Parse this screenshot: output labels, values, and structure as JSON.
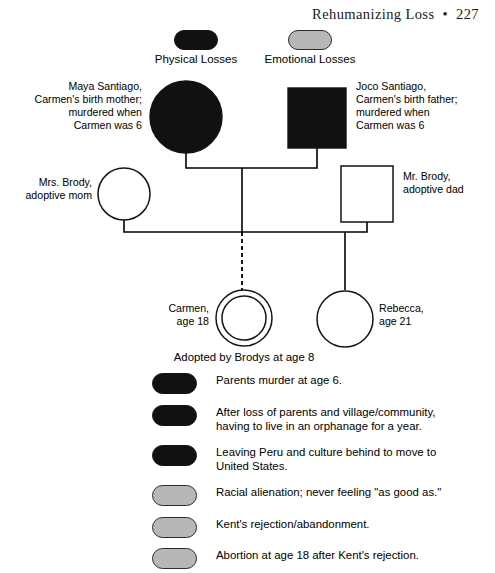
{
  "page": {
    "header": "Rehumanizing Loss  •  227"
  },
  "key": {
    "items": [
      {
        "label": "Physical Losses",
        "color": "#111111",
        "type": "physical"
      },
      {
        "label": "Emotional Losses",
        "color": "#b7b7b7",
        "type": "emotional"
      }
    ]
  },
  "genogram": {
    "people": [
      {
        "id": "maya",
        "label": "Maya Santiago,\nCarmen's birth mother;\nmurdered when\nCarmen was 6",
        "lines": [
          "Maya Santiago,",
          "Carmen's birth mother;",
          "murdered when",
          "Carmen was 6"
        ],
        "shape": "circle",
        "fill": "filled",
        "role": "birth-mother"
      },
      {
        "id": "joco",
        "label": "Joco Santiago,\nCarmen's birth father;\nmurdered when\nCarmen was 6",
        "lines": [
          "Joco Santiago,",
          "Carmen's birth father;",
          "murdered when",
          "Carmen was 6"
        ],
        "shape": "square",
        "fill": "filled",
        "role": "birth-father"
      },
      {
        "id": "mrs-brody",
        "label": "Mrs. Brody,\nadoptive mom",
        "lines": [
          "Mrs. Brody,",
          "adoptive mom"
        ],
        "shape": "circle",
        "fill": "open",
        "role": "adoptive-mother"
      },
      {
        "id": "mr-brody",
        "label": "Mr. Brody,\nadoptive dad",
        "lines": [
          "Mr. Brody,",
          "adoptive dad"
        ],
        "shape": "square",
        "fill": "open",
        "role": "adoptive-father"
      },
      {
        "id": "carmen",
        "label": "Carmen,\nage 18",
        "lines": [
          "Carmen,",
          "age 18"
        ],
        "shape": "double-circle",
        "fill": "open",
        "role": "identified-patient",
        "age": 18
      },
      {
        "id": "rebecca",
        "label": "Rebecca,\nage 21",
        "lines": [
          "Rebecca,",
          "age 21"
        ],
        "shape": "circle",
        "fill": "open",
        "role": "sibling",
        "age": 21
      }
    ],
    "caption": "Adopted by Brodys at age 8"
  },
  "losses": {
    "items": [
      {
        "text": "Parents murder at age 6.",
        "type": "physical",
        "color": "#111111"
      },
      {
        "text": "After loss of parents and village/community,\nhaving to live in an orphanage for a year.",
        "type": "physical",
        "color": "#111111"
      },
      {
        "text": "Leaving Peru and culture behind to move to\nUnited States.",
        "type": "physical",
        "color": "#111111"
      },
      {
        "text": "Racial alienation; never feeling \"as good as.\"",
        "type": "emotional",
        "color": "#b7b7b7"
      },
      {
        "text": "Kent's rejection/abandonment.",
        "type": "emotional",
        "color": "#b7b7b7"
      },
      {
        "text": "Abortion at age 18 after Kent's rejection.",
        "type": "emotional",
        "color": "#b7b7b7"
      }
    ]
  }
}
